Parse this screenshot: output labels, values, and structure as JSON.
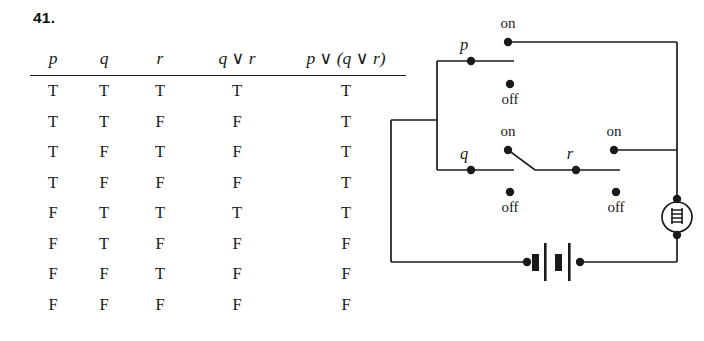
{
  "problem": {
    "number": "41."
  },
  "table": {
    "headers": [
      {
        "text": "p",
        "parts": [
          "p"
        ]
      },
      {
        "text": "q",
        "parts": [
          "q"
        ]
      },
      {
        "text": "r",
        "parts": [
          "r"
        ]
      },
      {
        "text": "q ∨ r",
        "parts": [
          "q",
          "∨",
          "r"
        ]
      },
      {
        "text": "p ∨ (q ∨ r)",
        "parts": [
          "p",
          "∨",
          "(q",
          "∨",
          "r)"
        ]
      }
    ],
    "header_labels": {
      "p": "p",
      "q": "q",
      "r": "r",
      "q_or_r": "q ∨ r",
      "p_or_q_or_r": "p ∨ (q ∨ r)"
    },
    "vee_symbol": "∨",
    "rows": [
      {
        "p": "T",
        "q": "T",
        "r": "T",
        "q_or_r": "T",
        "p_or_q_or_r": "T"
      },
      {
        "p": "T",
        "q": "T",
        "r": "F",
        "q_or_r": "F",
        "p_or_q_or_r": "T"
      },
      {
        "p": "T",
        "q": "F",
        "r": "T",
        "q_or_r": "F",
        "p_or_q_or_r": "T"
      },
      {
        "p": "T",
        "q": "F",
        "r": "F",
        "q_or_r": "F",
        "p_or_q_or_r": "T"
      },
      {
        "p": "F",
        "q": "T",
        "r": "T",
        "q_or_r": "T",
        "p_or_q_or_r": "T"
      },
      {
        "p": "F",
        "q": "T",
        "r": "F",
        "q_or_r": "F",
        "p_or_q_or_r": "F"
      },
      {
        "p": "F",
        "q": "F",
        "r": "T",
        "q_or_r": "F",
        "p_or_q_or_r": "F"
      },
      {
        "p": "F",
        "q": "F",
        "r": "F",
        "q_or_r": "F",
        "p_or_q_or_r": "F"
      }
    ]
  },
  "circuit": {
    "switches": [
      {
        "name": "p",
        "label": "p",
        "on_label": "on",
        "off_label": "off"
      },
      {
        "name": "q",
        "label": "q",
        "on_label": "on",
        "off_label": "off"
      },
      {
        "name": "r",
        "label": "r",
        "on_label": "on",
        "off_label": "off"
      }
    ],
    "labels": {
      "p": "p",
      "q": "q",
      "r": "r",
      "p_on": "on",
      "p_off": "off",
      "q_on": "on",
      "q_off": "off",
      "r_on": "on",
      "r_off": "off"
    },
    "components": {
      "battery": "battery",
      "lamp": "light-bulb"
    },
    "colors": {
      "wire": "#1a1a1a",
      "background": "#ffffff"
    }
  }
}
